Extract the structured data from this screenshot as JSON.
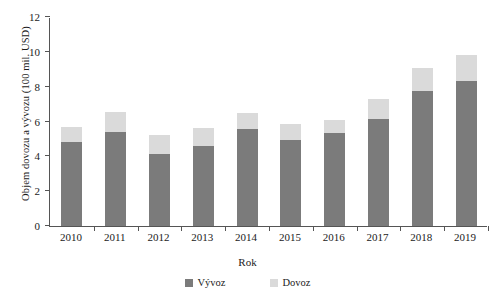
{
  "chart_data": {
    "type": "bar",
    "subtype": "stacked",
    "title": "",
    "xlabel": "Rok",
    "ylabel": "Objem dovozu a vývozu (100 mil. USD)",
    "categories": [
      "2010",
      "2011",
      "2012",
      "2013",
      "2014",
      "2015",
      "2016",
      "2017",
      "2018",
      "2019"
    ],
    "series": [
      {
        "name": "Vývoz",
        "color": "#7b7b7b",
        "values": [
          4.85,
          5.4,
          4.15,
          4.6,
          5.55,
          4.95,
          5.35,
          6.15,
          7.75,
          8.3
        ]
      },
      {
        "name": "Dovoz",
        "color": "#dadada",
        "values": [
          0.85,
          1.15,
          1.05,
          1.0,
          0.95,
          0.9,
          0.75,
          1.15,
          1.35,
          1.5
        ]
      }
    ],
    "totals": [
      5.7,
      6.55,
      5.2,
      5.6,
      6.5,
      5.85,
      6.1,
      7.3,
      9.1,
      9.8
    ],
    "ylim": [
      0,
      12
    ],
    "yticks": [
      0,
      2,
      4,
      6,
      8,
      10,
      12
    ],
    "ytick_labels": [
      "0",
      "2",
      "4",
      "6",
      "8",
      "10",
      "12"
    ],
    "grid": false,
    "legend_position": "bottom"
  },
  "legend": {
    "items": [
      {
        "label": "Vývoz",
        "swatch": "export-swatch"
      },
      {
        "label": "Dovoz",
        "swatch": "import-swatch"
      }
    ]
  },
  "axes": {
    "y_title": "Objem dovozu a vývozu (100 mil. USD)",
    "x_title": "Rok"
  }
}
